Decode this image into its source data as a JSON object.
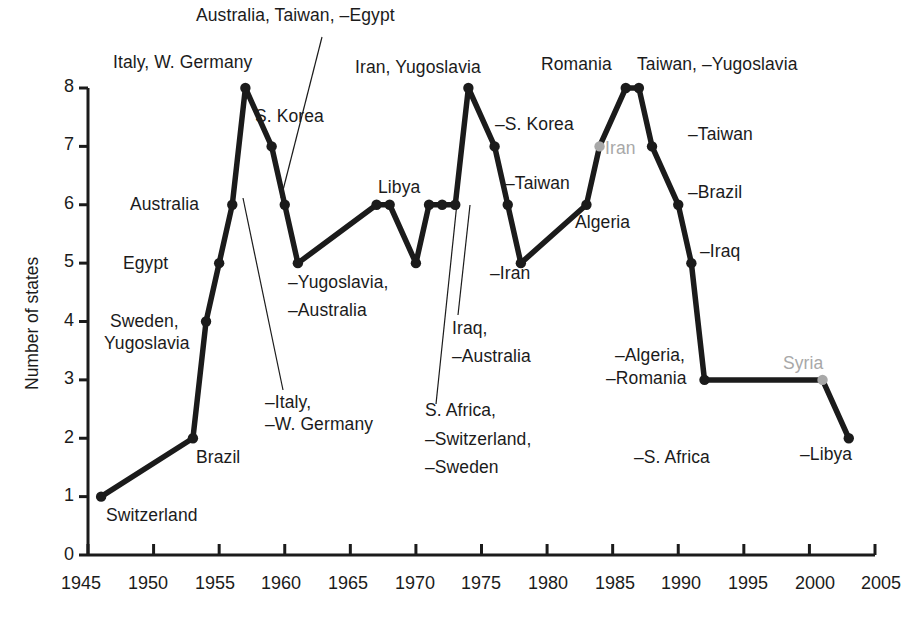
{
  "chart_data": {
    "type": "line",
    "title": "",
    "xlabel": "",
    "ylabel": "Number of states",
    "xlim": [
      1945,
      2005
    ],
    "ylim": [
      0,
      8
    ],
    "grid": false,
    "legend": "none",
    "xticks": [
      "1945",
      "1950",
      "1955",
      "1960",
      "1965",
      "1970",
      "1975",
      "1980",
      "1985",
      "1990",
      "1995",
      "2000",
      "2005"
    ],
    "yticks": [
      "0",
      "1",
      "2",
      "3",
      "4",
      "5",
      "6",
      "7",
      "8"
    ],
    "x": [
      1946,
      1953,
      1954,
      1955,
      1956,
      1957,
      1959,
      1960,
      1961,
      1967,
      1968,
      1970,
      1971,
      1972,
      1973,
      1974,
      1976,
      1977,
      1978,
      1983,
      1984,
      1986,
      1987,
      1988,
      1990,
      1991,
      1992,
      2001,
      2003
    ],
    "values": [
      1,
      2,
      4,
      5,
      6,
      8,
      7,
      6,
      5,
      6,
      6,
      5,
      6,
      6,
      6,
      8,
      7,
      6,
      5,
      6,
      7,
      8,
      8,
      7,
      6,
      5,
      3,
      3,
      2
    ],
    "series": [
      {
        "name": "Number of states with nuclear weapons programs",
        "values": [
          1,
          2,
          4,
          5,
          6,
          8,
          7,
          6,
          5,
          6,
          6,
          5,
          6,
          6,
          6,
          8,
          7,
          6,
          5,
          6,
          7,
          8,
          8,
          7,
          6,
          5,
          3,
          3,
          2
        ]
      }
    ],
    "highlight_points": [
      {
        "x": 1984,
        "y": 7,
        "label": "Iran",
        "color": "#a8a8a8"
      },
      {
        "x": 2001,
        "y": 3,
        "label": "Syria",
        "color": "#a8a8a8"
      }
    ],
    "annotations": [
      {
        "text": "Switzerland",
        "x": 1946,
        "y": 1
      },
      {
        "text": "Brazil",
        "x": 1953,
        "y": 2
      },
      {
        "text": "Sweden,\nYugoslavia",
        "x": 1954,
        "y": 4
      },
      {
        "text": "Egypt",
        "x": 1955,
        "y": 5
      },
      {
        "text": "Australia",
        "x": 1956,
        "y": 6
      },
      {
        "text": "Italy, W. Germany",
        "x": 1957,
        "y": 8
      },
      {
        "text": "S. Korea",
        "x": 1959,
        "y": 7
      },
      {
        "text": "–Italy,\n–W. Germany",
        "x": 1960,
        "y": 6
      },
      {
        "text": "–Yugoslavia,\n–Australia",
        "x": 1961,
        "y": 5
      },
      {
        "text": "Libya",
        "x": 1967,
        "y": 6
      },
      {
        "text": "Australia, Taiwan, –Egypt",
        "x": 1968,
        "y": 6
      },
      {
        "text": "S. Africa,\n–Switzerland,\n–Sweden",
        "x": 1970,
        "y": 5
      },
      {
        "text": "Iraq,\n–Australia",
        "x": 1972,
        "y": 6
      },
      {
        "text": "Iran, Yugoslavia",
        "x": 1974,
        "y": 8
      },
      {
        "text": "–S. Korea",
        "x": 1976,
        "y": 7
      },
      {
        "text": "–Taiwan",
        "x": 1977,
        "y": 6
      },
      {
        "text": "–Iran",
        "x": 1978,
        "y": 5
      },
      {
        "text": "Algeria",
        "x": 1983,
        "y": 6
      },
      {
        "text": "Iran",
        "x": 1984,
        "y": 7
      },
      {
        "text": "Romania",
        "x": 1986,
        "y": 8
      },
      {
        "text": "Taiwan, –Yugoslavia",
        "x": 1987,
        "y": 8
      },
      {
        "text": "–Taiwan",
        "x": 1988,
        "y": 7
      },
      {
        "text": "–Brazil",
        "x": 1990,
        "y": 6
      },
      {
        "text": "–Iraq",
        "x": 1991,
        "y": 5
      },
      {
        "text": "–Algeria,\n–Romania",
        "x": 1992,
        "y": 3
      },
      {
        "text": "–S. Africa",
        "x": 1992,
        "y": 2
      },
      {
        "text": "Syria",
        "x": 2001,
        "y": 3
      },
      {
        "text": "–Libya",
        "x": 2003,
        "y": 2
      }
    ]
  },
  "axis": {
    "y_title": "Number of states",
    "y_tick_0": "0",
    "y_tick_1": "1",
    "y_tick_2": "2",
    "y_tick_3": "3",
    "y_tick_4": "4",
    "y_tick_5": "5",
    "y_tick_6": "6",
    "y_tick_7": "7",
    "y_tick_8": "8",
    "x_tick_1945": "1945",
    "x_tick_1950": "1950",
    "x_tick_1955": "1955",
    "x_tick_1960": "1960",
    "x_tick_1965": "1965",
    "x_tick_1970": "1970",
    "x_tick_1975": "1975",
    "x_tick_1980": "1980",
    "x_tick_1985": "1985",
    "x_tick_1990": "1990",
    "x_tick_1995": "1995",
    "x_tick_2000": "2000",
    "x_tick_2005": "2005"
  },
  "labels": {
    "switzerland": "Switzerland",
    "brazil_1953": "Brazil",
    "sweden_yugoslavia_l1": "Sweden,",
    "sweden_yugoslavia_l2": "Yugoslavia",
    "egypt": "Egypt",
    "australia_1956": "Australia",
    "italy_wgermany": "Italy, W. Germany",
    "skorea_1959": "S. Korea",
    "minus_italy_l1": "–Italy,",
    "minus_italy_l2": "–W. Germany",
    "minus_yugoslavia_l1": "–Yugoslavia,",
    "minus_yugoslavia_l2": "–Australia",
    "libya_1967": "Libya",
    "australia_taiwan_egypt": "Australia, Taiwan, –Egypt",
    "safrica_l1": "S. Africa,",
    "safrica_l2": "–Switzerland,",
    "safrica_l3": "–Sweden",
    "iraq_l1": "Iraq,",
    "iraq_l2": "–Australia",
    "iran_yugoslavia": "Iran, Yugoslavia",
    "minus_skorea": "–S. Korea",
    "minus_taiwan_1977": "–Taiwan",
    "minus_iran_1978": "–Iran",
    "algeria": "Algeria",
    "iran_1984": "Iran",
    "romania": "Romania",
    "taiwan_minus_yugoslavia": "Taiwan, –Yugoslavia",
    "minus_taiwan_1988": "–Taiwan",
    "minus_brazil": "–Brazil",
    "minus_iraq": "–Iraq",
    "minus_algeria_l1": "–Algeria,",
    "minus_algeria_l2": "–Romania",
    "minus_safrica": "–S. Africa",
    "syria": "Syria",
    "minus_libya": "–Libya"
  },
  "colors": {
    "line": "#1b1b1b",
    "highlight": "#a8a8a8",
    "axis": "#1b1b1b",
    "background": "#ffffff"
  }
}
